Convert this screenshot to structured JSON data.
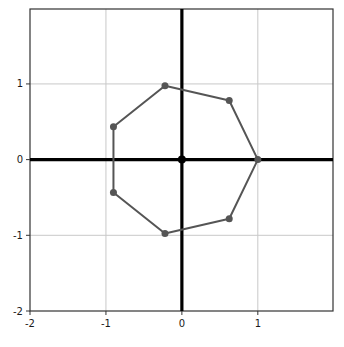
{
  "chart_data": {
    "type": "line",
    "title": "",
    "xlabel": "",
    "ylabel": "",
    "xlim": [
      -2,
      1.99
    ],
    "ylim": [
      -2,
      1.99
    ],
    "grid": true,
    "legend": null,
    "closed_path": true,
    "marker": "circle",
    "xticks": [
      -2,
      -1,
      0,
      1
    ],
    "xtick_labels": [
      "-2",
      "-1",
      "0",
      "1"
    ],
    "yticks": [
      -2,
      -1,
      0,
      1
    ],
    "ytick_labels": [
      "-2",
      "-1",
      "0",
      "1"
    ],
    "gridlines_x": [
      -1,
      1
    ],
    "gridlines_y": [
      -1,
      1
    ],
    "axis_lines": {
      "x_axis_at": 0,
      "y_axis_at": 0
    },
    "points": [
      {
        "label": "P0",
        "x": 1.0,
        "y": 0.0
      },
      {
        "label": "P1",
        "x": 0.6235,
        "y": 0.7818
      },
      {
        "label": "P2",
        "x": -0.2225,
        "y": 0.9749
      },
      {
        "label": "P3",
        "x": -0.901,
        "y": 0.4339
      },
      {
        "label": "P4",
        "x": -0.901,
        "y": -0.4339
      },
      {
        "label": "P5",
        "x": -0.2225,
        "y": -0.9749
      },
      {
        "label": "P6",
        "x": 0.6235,
        "y": -0.7818
      }
    ],
    "x": [
      1.0,
      0.6235,
      -0.2225,
      -0.901,
      -0.901,
      -0.2225,
      0.6235
    ],
    "y": [
      0.0,
      0.7818,
      0.9749,
      0.4339,
      -0.4339,
      -0.9749,
      -0.7818
    ],
    "origin_marker": {
      "x": 0,
      "y": 0
    }
  },
  "style": {
    "series_color": "#555555",
    "axis_color": "#000000",
    "grid_color": "#c8c8c8",
    "frame_color": "#333333",
    "background": "#ffffff",
    "marker_size": 5,
    "line_width": 2
  }
}
